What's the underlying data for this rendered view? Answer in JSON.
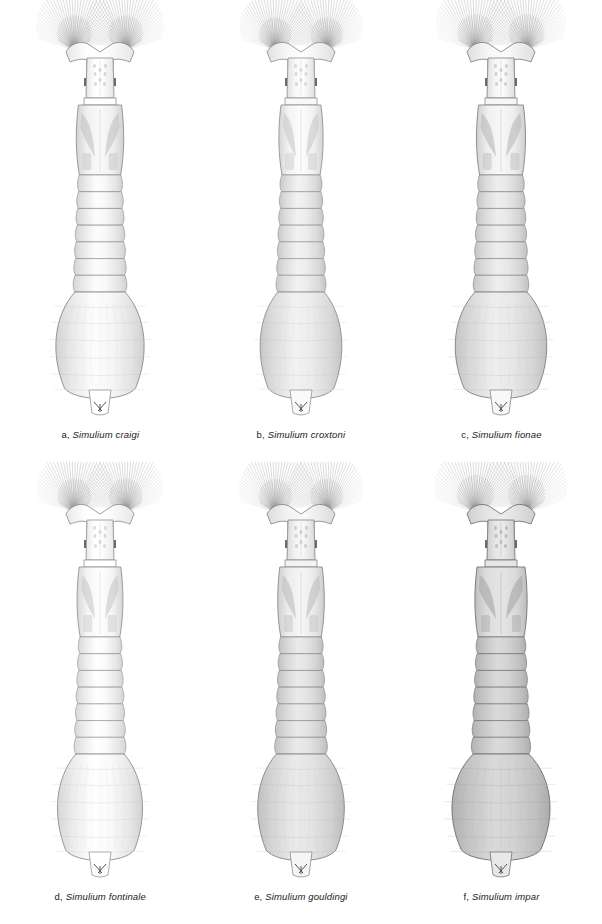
{
  "figure": {
    "background_color": "#ffffff",
    "ink_color": "#1a1a1a",
    "rows": 2,
    "columns": 3,
    "view": "dorsal"
  },
  "specimens": [
    {
      "letter": "a,",
      "species": "Simulium craigi",
      "caption": "a, Simulium craigi",
      "tone": "very-light",
      "body_fill": "#f4f4f4",
      "abdomen_fill": "#ededed",
      "thorax_fill": "#e8e8e8",
      "outline": "#8a8a8a",
      "abdomen_width": 54,
      "body_length": 390,
      "fan_spread": 62
    },
    {
      "letter": "b,",
      "species": "Simulium croxtoni",
      "caption": "b, Simulium croxtoni",
      "tone": "light-medium",
      "body_fill": "#eeeeee",
      "abdomen_fill": "#e2e2e2",
      "thorax_fill": "#ebebeb",
      "outline": "#8f8f8f",
      "abdomen_width": 50,
      "body_length": 385,
      "fan_spread": 58
    },
    {
      "letter": "c,",
      "species": "Simulium fionae",
      "caption": "c, Simulium fionae",
      "tone": "medium",
      "body_fill": "#ececec",
      "abdomen_fill": "#dedede",
      "thorax_fill": "#e6e6e6",
      "outline": "#808080",
      "abdomen_width": 56,
      "body_length": 395,
      "fan_spread": 64
    },
    {
      "letter": "d,",
      "species": "Simulium fontinale",
      "caption": "d, Simulium fontinale",
      "tone": "very-light",
      "body_fill": "#f6f6f6",
      "abdomen_fill": "#f0f0f0",
      "thorax_fill": "#ededed",
      "outline": "#909090",
      "abdomen_width": 52,
      "body_length": 388,
      "fan_spread": 60
    },
    {
      "letter": "e,",
      "species": "Simulium gouldingi",
      "caption": "e, Simulium gouldingi",
      "tone": "medium",
      "body_fill": "#e9e9e9",
      "abdomen_fill": "#dadada",
      "thorax_fill": "#e4e4e4",
      "outline": "#858585",
      "abdomen_width": 53,
      "body_length": 386,
      "fan_spread": 59
    },
    {
      "letter": "f,",
      "species": "Simulium impar",
      "caption": "f, Simulium impar",
      "tone": "dark",
      "body_fill": "#dcdcdc",
      "abdomen_fill": "#c9c9c9",
      "thorax_fill": "#d4d4d4",
      "outline": "#6e6e6e",
      "abdomen_width": 60,
      "body_length": 398,
      "fan_spread": 66
    }
  ]
}
